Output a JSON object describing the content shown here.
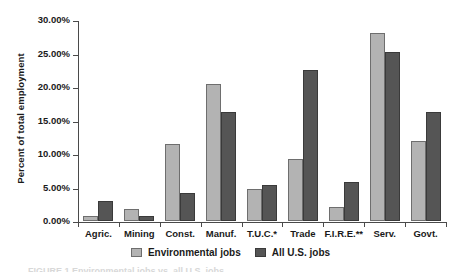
{
  "chart_data": {
    "type": "bar",
    "title": "",
    "xlabel": "",
    "ylabel": "Percent of total employment",
    "categories": [
      "Agric.",
      "Mining",
      "Const.",
      "Manuf.",
      "T.U.C.*",
      "Trade",
      "F.I.R.E.**",
      "Serv.",
      "Govt."
    ],
    "series": [
      {
        "name": "Environmental jobs",
        "color": "#b3b3b3",
        "values": [
          0.7,
          1.8,
          11.5,
          20.4,
          4.8,
          9.3,
          2.1,
          28.0,
          11.9
        ]
      },
      {
        "name": "All U.S. jobs",
        "color": "#555555",
        "values": [
          3.0,
          0.7,
          4.2,
          16.2,
          5.4,
          22.5,
          5.8,
          25.3,
          16.3
        ]
      }
    ],
    "ylim": [
      0,
      30
    ],
    "ytick_values": [
      0,
      5,
      10,
      15,
      20,
      25,
      30
    ],
    "ytick_labels": [
      "0.00%",
      "5.00%",
      "10.00%",
      "15.00%",
      "20.00%",
      "25.00%",
      "30.00%"
    ],
    "grid": false,
    "legend_position": "bottom",
    "legend": [
      "Environmental jobs",
      "All U.S. jobs"
    ]
  },
  "caption": {
    "sliver": "FIGURE 1 Environmental jobs vs. all U.S. jobs"
  }
}
